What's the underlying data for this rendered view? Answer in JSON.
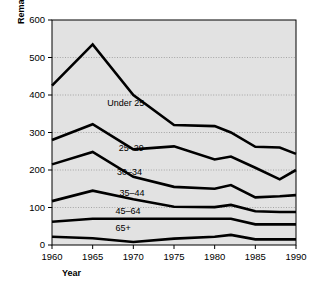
{
  "chart_data": {
    "type": "line",
    "title": "",
    "xlabel": "Year",
    "ylabel": "Remarriage rate",
    "x": [
      1960,
      1965,
      1970,
      1975,
      1980,
      1982,
      1985,
      1988,
      1990
    ],
    "xlim": [
      1960,
      1990
    ],
    "ylim": [
      0,
      600
    ],
    "xticks": [
      1960,
      1965,
      1970,
      1975,
      1980,
      1985,
      1990
    ],
    "xtick_labels": [
      "1960",
      "1965",
      "1970",
      "1975",
      "1980",
      "1985",
      "1990"
    ],
    "yticks": [
      0,
      100,
      200,
      300,
      400,
      500,
      600
    ],
    "ytick_labels": [
      "0",
      "100",
      "200",
      "300",
      "400",
      "500",
      "600"
    ],
    "grid": "horizontal-dotted",
    "legend": "inline-labels",
    "series": [
      {
        "name": "Under 25",
        "values": [
          425,
          535,
          400,
          320,
          317,
          300,
          262,
          260,
          243
        ]
      },
      {
        "name": "25-29",
        "values": [
          280,
          322,
          255,
          263,
          228,
          236,
          206,
          175,
          200
        ]
      },
      {
        "name": "30-34",
        "values": [
          215,
          248,
          182,
          155,
          150,
          160,
          127,
          130,
          133
        ]
      },
      {
        "name": "35-44",
        "values": [
          117,
          145,
          122,
          102,
          101,
          107,
          90,
          88,
          88
        ]
      },
      {
        "name": "45-64",
        "values": [
          62,
          70,
          70,
          70,
          70,
          70,
          55,
          55,
          55
        ]
      },
      {
        "name": "65+",
        "values": [
          22,
          18,
          8,
          17,
          22,
          27,
          15,
          15,
          15
        ]
      }
    ],
    "series_label_positions": [
      {
        "name": "Under 25",
        "x": 1966.8,
        "y": 372
      },
      {
        "name": "25-29",
        "x": 1968.2,
        "y": 252
      },
      {
        "name": "30-34",
        "x": 1968.0,
        "y": 186
      },
      {
        "name": "35-44",
        "x": 1968.3,
        "y": 130
      },
      {
        "name": "45-64",
        "x": 1967.8,
        "y": 82
      },
      {
        "name": "65+",
        "x": 1967.8,
        "y": 37
      }
    ]
  }
}
